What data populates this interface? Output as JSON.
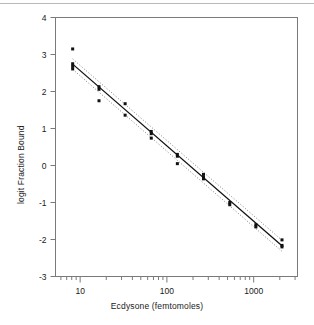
{
  "figure": {
    "background_color": "#ffffff",
    "frame_color": "#7a7a7a",
    "top_rule_color": "#b9b9b9"
  },
  "chart_data": {
    "type": "scatter",
    "title": "",
    "xlabel": "Ecdysone (femtomoles)",
    "ylabel": "logit Fraction Bound",
    "xscale": "log",
    "yscale": "linear",
    "xlim": [
      5.2,
      3200
    ],
    "ylim": [
      -3,
      4
    ],
    "xticks_major": [
      10,
      100,
      1000
    ],
    "xtick_labels": [
      "10",
      "100",
      "1000"
    ],
    "xticks_minor": [
      6,
      7,
      8,
      9,
      20,
      30,
      40,
      50,
      60,
      70,
      80,
      90,
      200,
      300,
      400,
      500,
      600,
      700,
      800,
      900,
      2000,
      3000
    ],
    "yticks": [
      -3,
      -2,
      -1,
      0,
      1,
      2,
      3,
      4
    ],
    "ytick_labels": [
      "-3",
      "-2",
      "-1",
      "0",
      "1",
      "2",
      "3",
      "4"
    ],
    "grid": false,
    "legend": null,
    "series": [
      {
        "name": "observed",
        "type": "scatter",
        "marker": "square",
        "marker_size": 3,
        "color": "#111111",
        "points": [
          {
            "x": 8.2,
            "y": 3.15
          },
          {
            "x": 8.2,
            "y": 2.75
          },
          {
            "x": 8.2,
            "y": 2.68
          },
          {
            "x": 8.2,
            "y": 2.61
          },
          {
            "x": 16.5,
            "y": 2.13
          },
          {
            "x": 16.5,
            "y": 2.06
          },
          {
            "x": 16.5,
            "y": 1.75
          },
          {
            "x": 33.0,
            "y": 1.67
          },
          {
            "x": 33.0,
            "y": 1.36
          },
          {
            "x": 66.0,
            "y": 0.92
          },
          {
            "x": 66.0,
            "y": 0.86
          },
          {
            "x": 66.0,
            "y": 0.74
          },
          {
            "x": 132.0,
            "y": 0.3
          },
          {
            "x": 132.0,
            "y": 0.25
          },
          {
            "x": 132.0,
            "y": 0.05
          },
          {
            "x": 264.0,
            "y": -0.24
          },
          {
            "x": 264.0,
            "y": -0.31
          },
          {
            "x": 264.0,
            "y": -0.36
          },
          {
            "x": 530.0,
            "y": -1.0
          },
          {
            "x": 530.0,
            "y": -1.06
          },
          {
            "x": 1060.0,
            "y": -1.6
          },
          {
            "x": 1060.0,
            "y": -1.66
          },
          {
            "x": 2120.0,
            "y": -2.01
          },
          {
            "x": 2120.0,
            "y": -2.16
          },
          {
            "x": 2120.0,
            "y": -2.2
          }
        ]
      },
      {
        "name": "regression-line",
        "type": "line",
        "style": "solid",
        "color": "#111111",
        "endpoints": [
          {
            "x": 8.2,
            "y": 2.74
          },
          {
            "x": 2120.0,
            "y": -2.17
          }
        ],
        "slope_per_decade": -2.04
      },
      {
        "name": "confidence-band-upper",
        "type": "line",
        "style": "dotted",
        "color": "#808080",
        "endpoints": [
          {
            "x": 8.2,
            "y": 2.88
          },
          {
            "x": 2120.0,
            "y": -2.02
          }
        ]
      },
      {
        "name": "confidence-band-lower",
        "type": "line",
        "style": "dotted",
        "color": "#808080",
        "endpoints": [
          {
            "x": 8.2,
            "y": 2.6
          },
          {
            "x": 2120.0,
            "y": -2.32
          }
        ]
      }
    ]
  }
}
